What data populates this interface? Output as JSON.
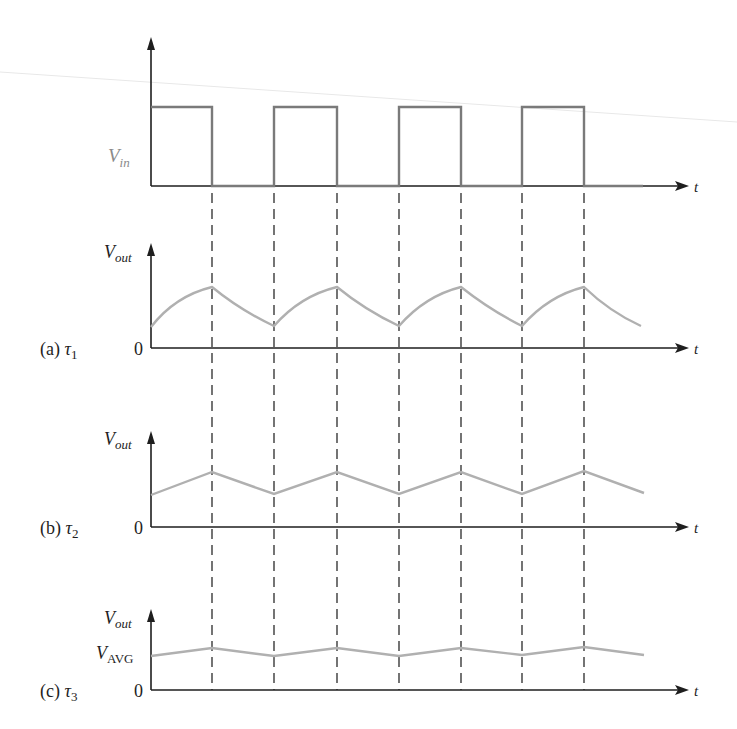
{
  "figure": {
    "input": {
      "label_main": "V",
      "label_sub": "in",
      "time_label": "t"
    },
    "panels": [
      {
        "id": "a",
        "caption_prefix": "(a) ",
        "caption_symbol": "τ",
        "caption_sub": "1",
        "y_label_main": "V",
        "y_label_sub": "out",
        "zero_label": "0",
        "time_label": "t",
        "shape": "exponential charge/discharge (large ripple)"
      },
      {
        "id": "b",
        "caption_prefix": "(b) ",
        "caption_symbol": "τ",
        "caption_sub": "2",
        "y_label_main": "V",
        "y_label_sub": "out",
        "zero_label": "0",
        "time_label": "t",
        "shape": "near-triangular (medium ripple)"
      },
      {
        "id": "c",
        "caption_prefix": "(c) ",
        "caption_symbol": "τ",
        "caption_sub": "3",
        "y_label_main": "V",
        "y_label_sub": "out",
        "avg_label_main": "V",
        "avg_label_sub": "AVG",
        "zero_label": "0",
        "time_label": "t",
        "shape": "small ripple around average"
      }
    ],
    "edges_x": [
      212,
      274,
      337,
      399,
      461,
      522,
      584
    ],
    "colors": {
      "axis": "#1e1e1e",
      "square_wave": "#7a7a7a",
      "output_curves": "#b0b0b0",
      "dashed_guides": "#2a2a2a"
    }
  }
}
